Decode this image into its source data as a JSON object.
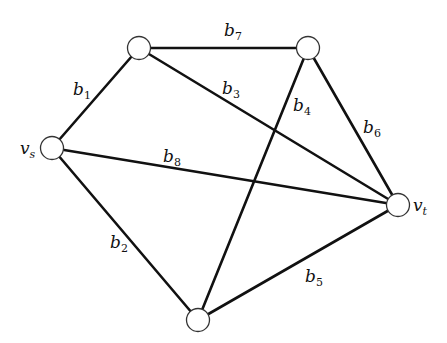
{
  "graph": {
    "nodes": [
      {
        "id": "vs",
        "label": "v",
        "sub": "s",
        "x": 52,
        "y": 148
      },
      {
        "id": "n1",
        "label": "",
        "x": 139,
        "y": 48
      },
      {
        "id": "n2",
        "label": "",
        "x": 308,
        "y": 48
      },
      {
        "id": "vt",
        "label": "v",
        "sub": "t",
        "x": 398,
        "y": 205
      },
      {
        "id": "n3",
        "label": "",
        "x": 198,
        "y": 320
      }
    ],
    "edges": [
      {
        "id": "b1",
        "label": "b",
        "sub": "1",
        "from": "vs",
        "to": "n1"
      },
      {
        "id": "b2",
        "label": "b",
        "sub": "2",
        "from": "vs",
        "to": "n3"
      },
      {
        "id": "b3",
        "label": "b",
        "sub": "3",
        "from": "n1",
        "to": "vt"
      },
      {
        "id": "b4",
        "label": "b",
        "sub": "4",
        "from": "n2",
        "to": "n3"
      },
      {
        "id": "b5",
        "label": "b",
        "sub": "5",
        "from": "n3",
        "to": "vt"
      },
      {
        "id": "b6",
        "label": "b",
        "sub": "6",
        "from": "n2",
        "to": "vt"
      },
      {
        "id": "b7",
        "label": "b",
        "sub": "7",
        "from": "n1",
        "to": "n2"
      },
      {
        "id": "b8",
        "label": "b",
        "sub": "8",
        "from": "vs",
        "to": "vt"
      }
    ]
  },
  "labels": {
    "vs": {
      "main": "v",
      "sub": "s"
    },
    "vt": {
      "main": "v",
      "sub": "t"
    },
    "b1": {
      "main": "b",
      "sub": "1"
    },
    "b2": {
      "main": "b",
      "sub": "2"
    },
    "b3": {
      "main": "b",
      "sub": "3"
    },
    "b4": {
      "main": "b",
      "sub": "4"
    },
    "b5": {
      "main": "b",
      "sub": "5"
    },
    "b6": {
      "main": "b",
      "sub": "6"
    },
    "b7": {
      "main": "b",
      "sub": "7"
    },
    "b8": {
      "main": "b",
      "sub": "8"
    }
  }
}
